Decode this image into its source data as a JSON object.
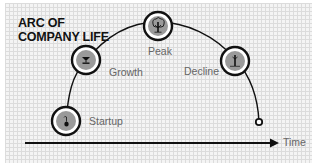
{
  "title": {
    "line1": "ARC OF",
    "line2": "COMPANY LIFE"
  },
  "axis": {
    "label": "Time"
  },
  "stages": [
    {
      "name": "Startup",
      "icon": "seedling-icon"
    },
    {
      "name": "Growth",
      "icon": "sapling-icon"
    },
    {
      "name": "Peak",
      "icon": "tree-icon"
    },
    {
      "name": "Decline",
      "icon": "bare-tree-icon"
    }
  ],
  "colors": {
    "background": "#f4f4f4",
    "grid": "#dcdcdc",
    "line": "#111111",
    "node_fill": "#9a9a9a",
    "label_text": "#666666"
  }
}
